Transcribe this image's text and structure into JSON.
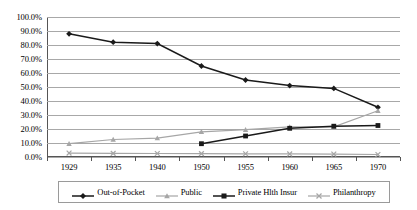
{
  "chart_data": {
    "type": "line",
    "title": "",
    "xlabel": "",
    "ylabel": "",
    "categories": [
      "1929",
      "1935",
      "1940",
      "1950",
      "1955",
      "1960",
      "1965",
      "1970"
    ],
    "ylim": [
      0,
      100
    ],
    "ytick_labels": [
      "0.0%",
      "10.0%",
      "20.0%",
      "30.0%",
      "40.0%",
      "50.0%",
      "60.0%",
      "70.0%",
      "80.0%",
      "90.0%",
      "100.0%"
    ],
    "ytick_values": [
      0,
      10,
      20,
      30,
      40,
      50,
      60,
      70,
      80,
      90,
      100
    ],
    "grid": true,
    "legend_position": "bottom",
    "series": [
      {
        "name": "Out-of-Pocket",
        "marker": "diamond",
        "color": "#1a1a1a",
        "values": [
          88.0,
          82.0,
          81.0,
          65.0,
          55.0,
          51.0,
          49.0,
          35.5
        ]
      },
      {
        "name": "Public",
        "marker": "triangle",
        "color": "#a6a6a6",
        "values": [
          9.5,
          12.5,
          13.5,
          18.0,
          19.5,
          21.5,
          21.5,
          33.0
        ]
      },
      {
        "name": "Private Hlth Insur",
        "marker": "square",
        "color": "#1a1a1a",
        "values": [
          null,
          null,
          null,
          9.5,
          15.0,
          20.5,
          22.0,
          22.5
        ]
      },
      {
        "name": "Philanthropy",
        "marker": "x",
        "color": "#a6a6a6",
        "values": [
          2.8,
          2.6,
          2.5,
          2.4,
          2.3,
          2.2,
          2.1,
          1.8
        ]
      }
    ]
  }
}
